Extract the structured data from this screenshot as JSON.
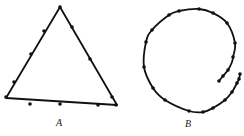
{
  "figure": {
    "labels": {
      "a": "A",
      "b": "B"
    },
    "colors": {
      "stroke": "#111111",
      "background": "#ffffff"
    },
    "triangle": {
      "vertices": [
        [
          60,
          7
        ],
        [
          6,
          98
        ],
        [
          117,
          105
        ]
      ],
      "dots": [
        [
          60,
          7
        ],
        [
          44,
          31
        ],
        [
          31,
          54
        ],
        [
          14,
          82
        ],
        [
          6,
          97
        ],
        [
          72,
          27
        ],
        [
          90,
          59
        ],
        [
          112,
          97
        ],
        [
          116,
          105
        ],
        [
          30,
          104
        ],
        [
          60,
          104
        ],
        [
          98,
          105
        ]
      ]
    },
    "spiral": {
      "path": [
        [
          219,
          81
        ],
        [
          223,
          76
        ],
        [
          228,
          70
        ],
        [
          232,
          62
        ],
        [
          233,
          57
        ],
        [
          235,
          43
        ],
        [
          227,
          23
        ],
        [
          213,
          13
        ],
        [
          199,
          9
        ],
        [
          179,
          11
        ],
        [
          169,
          15
        ],
        [
          152,
          30
        ],
        [
          146,
          42
        ],
        [
          144,
          67
        ],
        [
          153,
          88
        ],
        [
          165,
          100
        ],
        [
          189,
          111
        ],
        [
          203,
          112
        ],
        [
          213,
          108
        ],
        [
          225,
          100
        ],
        [
          232,
          92
        ],
        [
          237,
          83
        ],
        [
          239,
          79
        ],
        [
          240,
          74
        ]
      ],
      "dots": [
        [
          219,
          81
        ],
        [
          223,
          76
        ],
        [
          228,
          70
        ],
        [
          233,
          57
        ],
        [
          235,
          43
        ],
        [
          227,
          23
        ],
        [
          213,
          13
        ],
        [
          199,
          9
        ],
        [
          179,
          11
        ],
        [
          169,
          15
        ],
        [
          152,
          30
        ],
        [
          146,
          42
        ],
        [
          144,
          67
        ],
        [
          153,
          88
        ],
        [
          165,
          100
        ],
        [
          189,
          111
        ],
        [
          203,
          112
        ],
        [
          213,
          108
        ],
        [
          225,
          100
        ],
        [
          232,
          92
        ],
        [
          237,
          83
        ],
        [
          239,
          79
        ],
        [
          240,
          74
        ]
      ]
    }
  }
}
